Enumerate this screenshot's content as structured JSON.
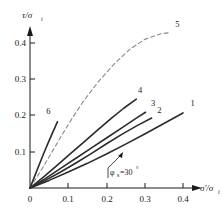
{
  "chart_data": {
    "type": "line",
    "title": "",
    "xlabel": "σ'/σᵢ",
    "ylabel": "τ/σᵢ",
    "xlim": [
      0,
      0.45
    ],
    "ylim": [
      0,
      0.45
    ],
    "grid": false,
    "legend": "inline-curve-labels",
    "xticks": [
      0,
      0.1,
      0.2,
      0.3,
      0.4
    ],
    "xticklabels": [
      "0",
      "0.1",
      "0.2",
      "0.3",
      "0.4"
    ],
    "yticks": [
      0.1,
      0.2,
      0.3,
      0.4
    ],
    "yticklabels": [
      "0.1",
      "0.2",
      "0.3",
      "0.4"
    ],
    "annotations": [
      {
        "text": "φₛ=30°",
        "x": 0.175,
        "y": 0.068,
        "leader_to_x": 0.155,
        "leader_to_y": 0.105
      }
    ],
    "series": [
      {
        "name": "1",
        "label": "1",
        "style": "solid",
        "points": [
          [
            0,
            0
          ],
          [
            0.05,
            0.021
          ],
          [
            0.1,
            0.044
          ],
          [
            0.15,
            0.068
          ],
          [
            0.2,
            0.094
          ],
          [
            0.25,
            0.121
          ],
          [
            0.3,
            0.149
          ],
          [
            0.35,
            0.178
          ],
          [
            0.4,
            0.207
          ]
        ],
        "label_x": 0.425,
        "label_y": 0.225
      },
      {
        "name": "2",
        "label": "2",
        "style": "solid",
        "points": [
          [
            0,
            0
          ],
          [
            0.04,
            0.021
          ],
          [
            0.08,
            0.044
          ],
          [
            0.12,
            0.069
          ],
          [
            0.16,
            0.095
          ],
          [
            0.2,
            0.122
          ],
          [
            0.24,
            0.148
          ],
          [
            0.28,
            0.172
          ],
          [
            0.318,
            0.193
          ]
        ],
        "label_x": 0.338,
        "label_y": 0.207
      },
      {
        "name": "3",
        "label": "3",
        "style": "solid",
        "points": [
          [
            0,
            0
          ],
          [
            0.04,
            0.026
          ],
          [
            0.08,
            0.054
          ],
          [
            0.12,
            0.082
          ],
          [
            0.16,
            0.11
          ],
          [
            0.2,
            0.138
          ],
          [
            0.24,
            0.166
          ],
          [
            0.28,
            0.194
          ],
          [
            0.302,
            0.209
          ]
        ],
        "label_x": 0.322,
        "label_y": 0.227
      },
      {
        "name": "4",
        "label": "4",
        "style": "solid",
        "points": [
          [
            0,
            0
          ],
          [
            0.035,
            0.03
          ],
          [
            0.07,
            0.062
          ],
          [
            0.105,
            0.094
          ],
          [
            0.14,
            0.126
          ],
          [
            0.175,
            0.158
          ],
          [
            0.21,
            0.19
          ],
          [
            0.245,
            0.22
          ],
          [
            0.278,
            0.245
          ]
        ],
        "label_x": 0.288,
        "label_y": 0.262
      },
      {
        "name": "5",
        "label": "5",
        "style": "dashed",
        "points": [
          [
            0,
            0
          ],
          [
            0.025,
            0.042
          ],
          [
            0.05,
            0.086
          ],
          [
            0.08,
            0.14
          ],
          [
            0.11,
            0.192
          ],
          [
            0.14,
            0.24
          ],
          [
            0.18,
            0.295
          ],
          [
            0.22,
            0.342
          ],
          [
            0.26,
            0.382
          ],
          [
            0.3,
            0.41
          ],
          [
            0.34,
            0.425
          ],
          [
            0.362,
            0.428
          ]
        ],
        "label_x": 0.385,
        "label_y": 0.443
      },
      {
        "name": "6",
        "label": "6",
        "style": "solid",
        "points": [
          [
            0,
            0
          ],
          [
            0.012,
            0.032
          ],
          [
            0.024,
            0.064
          ],
          [
            0.036,
            0.096
          ],
          [
            0.048,
            0.126
          ],
          [
            0.06,
            0.155
          ],
          [
            0.072,
            0.183
          ]
        ],
        "label_x": 0.048,
        "label_y": 0.205
      }
    ]
  },
  "axes": {
    "y_axis_label_main": "τ/σ",
    "y_axis_label_sub": "i",
    "x_axis_label_main": "σ'/σ",
    "x_axis_label_sub": "i"
  },
  "ticks": {
    "x": [
      "0",
      "0.1",
      "0.2",
      "0.3",
      "0.4"
    ],
    "y": [
      "0.4",
      "0.3",
      "0.2",
      "0.1"
    ]
  },
  "curve_labels": {
    "c1": "1",
    "c2": "2",
    "c3": "3",
    "c4": "4",
    "c5": "5",
    "c6": "6"
  },
  "annotation": {
    "phi_symbol": "φ",
    "phi_sub": "s",
    "phi_value": "=30",
    "degree": "°"
  },
  "colors": {
    "axis": "#1a1a1a",
    "curve": "#2b2b2b",
    "dashed_curve": "#8a8a8a",
    "background": "#ffffff"
  }
}
